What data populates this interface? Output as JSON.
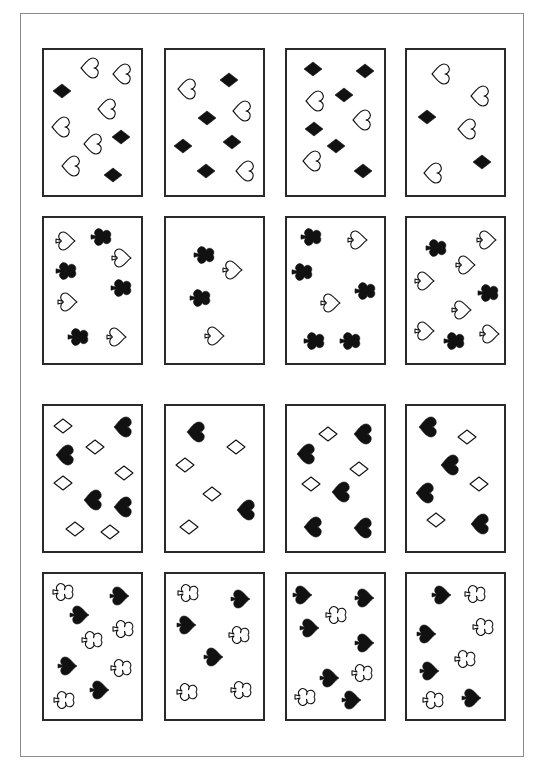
{
  "sheet": {
    "frame": {
      "x": 20,
      "y": 13,
      "w": 504,
      "h": 744
    },
    "colors": {
      "ink": "#111111",
      "card_border": "#2a2a2a",
      "frame_border": "#8a8a8a",
      "paper": "#ffffff"
    },
    "cards": [
      {
        "id": 1,
        "x": 42,
        "y": 48,
        "symbols": [
          {
            "s": "heart",
            "f": false,
            "x": 89,
            "y": 68
          },
          {
            "s": "heart",
            "f": false,
            "x": 121,
            "y": 74
          },
          {
            "s": "diamond",
            "f": true,
            "x": 62,
            "y": 91
          },
          {
            "s": "heart",
            "f": false,
            "x": 60,
            "y": 127
          },
          {
            "s": "heart",
            "f": false,
            "x": 106,
            "y": 109
          },
          {
            "s": "diamond",
            "f": true,
            "x": 121,
            "y": 137
          },
          {
            "s": "heart",
            "f": false,
            "x": 92,
            "y": 144
          },
          {
            "s": "heart",
            "f": false,
            "x": 70,
            "y": 166
          },
          {
            "s": "diamond",
            "f": true,
            "x": 113,
            "y": 175
          }
        ]
      },
      {
        "id": 2,
        "x": 164,
        "y": 48,
        "symbols": [
          {
            "s": "heart",
            "f": false,
            "x": 186,
            "y": 89
          },
          {
            "s": "diamond",
            "f": true,
            "x": 229,
            "y": 80
          },
          {
            "s": "diamond",
            "f": true,
            "x": 207,
            "y": 118
          },
          {
            "s": "heart",
            "f": false,
            "x": 241,
            "y": 111
          },
          {
            "s": "diamond",
            "f": true,
            "x": 183,
            "y": 146
          },
          {
            "s": "diamond",
            "f": true,
            "x": 232,
            "y": 142
          },
          {
            "s": "diamond",
            "f": true,
            "x": 206,
            "y": 171
          },
          {
            "s": "heart",
            "f": false,
            "x": 244,
            "y": 171
          }
        ]
      },
      {
        "id": 3,
        "x": 285,
        "y": 48,
        "symbols": [
          {
            "s": "diamond",
            "f": true,
            "x": 313,
            "y": 69
          },
          {
            "s": "diamond",
            "f": true,
            "x": 365,
            "y": 71
          },
          {
            "s": "heart",
            "f": false,
            "x": 314,
            "y": 101
          },
          {
            "s": "diamond",
            "f": true,
            "x": 344,
            "y": 95
          },
          {
            "s": "heart",
            "f": false,
            "x": 361,
            "y": 120
          },
          {
            "s": "diamond",
            "f": true,
            "x": 314,
            "y": 129
          },
          {
            "s": "diamond",
            "f": true,
            "x": 336,
            "y": 146
          },
          {
            "s": "heart",
            "f": false,
            "x": 311,
            "y": 161
          },
          {
            "s": "diamond",
            "f": true,
            "x": 363,
            "y": 171
          }
        ]
      },
      {
        "id": 4,
        "x": 405,
        "y": 48,
        "symbols": [
          {
            "s": "heart",
            "f": false,
            "x": 440,
            "y": 74
          },
          {
            "s": "heart",
            "f": false,
            "x": 479,
            "y": 96
          },
          {
            "s": "diamond",
            "f": true,
            "x": 427,
            "y": 117
          },
          {
            "s": "heart",
            "f": false,
            "x": 466,
            "y": 129
          },
          {
            "s": "diamond",
            "f": true,
            "x": 482,
            "y": 162
          },
          {
            "s": "heart",
            "f": false,
            "x": 432,
            "y": 173
          }
        ]
      },
      {
        "id": 5,
        "x": 42,
        "y": 216,
        "symbols": [
          {
            "s": "spade",
            "f": false,
            "x": 66,
            "y": 241
          },
          {
            "s": "club",
            "f": true,
            "x": 101,
            "y": 237
          },
          {
            "s": "spade",
            "f": false,
            "x": 122,
            "y": 258
          },
          {
            "s": "club",
            "f": true,
            "x": 66,
            "y": 271
          },
          {
            "s": "club",
            "f": true,
            "x": 121,
            "y": 288
          },
          {
            "s": "spade",
            "f": false,
            "x": 68,
            "y": 302
          },
          {
            "s": "club",
            "f": true,
            "x": 78,
            "y": 337
          },
          {
            "s": "spade",
            "f": false,
            "x": 117,
            "y": 337
          }
        ]
      },
      {
        "id": 6,
        "x": 164,
        "y": 216,
        "symbols": [
          {
            "s": "club",
            "f": true,
            "x": 204,
            "y": 255
          },
          {
            "s": "spade",
            "f": false,
            "x": 233,
            "y": 270
          },
          {
            "s": "club",
            "f": true,
            "x": 200,
            "y": 298
          },
          {
            "s": "spade",
            "f": false,
            "x": 215,
            "y": 336
          }
        ]
      },
      {
        "id": 7,
        "x": 285,
        "y": 216,
        "symbols": [
          {
            "s": "club",
            "f": true,
            "x": 311,
            "y": 237
          },
          {
            "s": "spade",
            "f": false,
            "x": 358,
            "y": 240
          },
          {
            "s": "club",
            "f": true,
            "x": 302,
            "y": 272
          },
          {
            "s": "spade",
            "f": false,
            "x": 331,
            "y": 303
          },
          {
            "s": "club",
            "f": true,
            "x": 365,
            "y": 291
          },
          {
            "s": "club",
            "f": true,
            "x": 314,
            "y": 341
          },
          {
            "s": "club",
            "f": true,
            "x": 350,
            "y": 341
          }
        ]
      },
      {
        "id": 8,
        "x": 405,
        "y": 216,
        "symbols": [
          {
            "s": "club",
            "f": true,
            "x": 436,
            "y": 248
          },
          {
            "s": "spade",
            "f": false,
            "x": 487,
            "y": 240
          },
          {
            "s": "spade",
            "f": false,
            "x": 466,
            "y": 265
          },
          {
            "s": "spade",
            "f": false,
            "x": 425,
            "y": 281
          },
          {
            "s": "club",
            "f": true,
            "x": 488,
            "y": 293
          },
          {
            "s": "spade",
            "f": false,
            "x": 462,
            "y": 310
          },
          {
            "s": "spade",
            "f": false,
            "x": 425,
            "y": 331
          },
          {
            "s": "club",
            "f": true,
            "x": 454,
            "y": 341
          },
          {
            "s": "spade",
            "f": false,
            "x": 490,
            "y": 334
          }
        ]
      },
      {
        "id": 9,
        "x": 42,
        "y": 404,
        "symbols": [
          {
            "s": "diamond",
            "f": false,
            "x": 63,
            "y": 426
          },
          {
            "s": "heart",
            "f": true,
            "x": 122,
            "y": 427
          },
          {
            "s": "heart",
            "f": true,
            "x": 64,
            "y": 455
          },
          {
            "s": "diamond",
            "f": false,
            "x": 95,
            "y": 447
          },
          {
            "s": "diamond",
            "f": false,
            "x": 124,
            "y": 473
          },
          {
            "s": "diamond",
            "f": false,
            "x": 63,
            "y": 483
          },
          {
            "s": "heart",
            "f": true,
            "x": 92,
            "y": 500
          },
          {
            "s": "heart",
            "f": true,
            "x": 122,
            "y": 507
          },
          {
            "s": "diamond",
            "f": false,
            "x": 75,
            "y": 529
          },
          {
            "s": "diamond",
            "f": false,
            "x": 110,
            "y": 532
          }
        ]
      },
      {
        "id": 10,
        "x": 164,
        "y": 404,
        "symbols": [
          {
            "s": "heart",
            "f": true,
            "x": 195,
            "y": 432
          },
          {
            "s": "diamond",
            "f": false,
            "x": 236,
            "y": 447
          },
          {
            "s": "diamond",
            "f": false,
            "x": 185,
            "y": 465
          },
          {
            "s": "diamond",
            "f": false,
            "x": 212,
            "y": 494
          },
          {
            "s": "heart",
            "f": true,
            "x": 245,
            "y": 510
          },
          {
            "s": "diamond",
            "f": false,
            "x": 189,
            "y": 527
          }
        ]
      },
      {
        "id": 11,
        "x": 285,
        "y": 404,
        "symbols": [
          {
            "s": "diamond",
            "f": false,
            "x": 328,
            "y": 434
          },
          {
            "s": "heart",
            "f": true,
            "x": 362,
            "y": 434
          },
          {
            "s": "heart",
            "f": true,
            "x": 305,
            "y": 454
          },
          {
            "s": "diamond",
            "f": false,
            "x": 359,
            "y": 469
          },
          {
            "s": "diamond",
            "f": false,
            "x": 311,
            "y": 484
          },
          {
            "s": "heart",
            "f": true,
            "x": 340,
            "y": 492
          },
          {
            "s": "heart",
            "f": true,
            "x": 312,
            "y": 527
          },
          {
            "s": "heart",
            "f": true,
            "x": 362,
            "y": 528
          }
        ]
      },
      {
        "id": 12,
        "x": 405,
        "y": 404,
        "symbols": [
          {
            "s": "heart",
            "f": true,
            "x": 427,
            "y": 427
          },
          {
            "s": "diamond",
            "f": false,
            "x": 467,
            "y": 437
          },
          {
            "s": "heart",
            "f": true,
            "x": 449,
            "y": 465
          },
          {
            "s": "diamond",
            "f": false,
            "x": 479,
            "y": 484
          },
          {
            "s": "heart",
            "f": true,
            "x": 424,
            "y": 493
          },
          {
            "s": "diamond",
            "f": false,
            "x": 436,
            "y": 520
          },
          {
            "s": "heart",
            "f": true,
            "x": 479,
            "y": 524
          }
        ]
      },
      {
        "id": 13,
        "x": 42,
        "y": 572,
        "symbols": [
          {
            "s": "club",
            "f": false,
            "x": 63,
            "y": 592
          },
          {
            "s": "spade",
            "f": true,
            "x": 120,
            "y": 596
          },
          {
            "s": "spade",
            "f": true,
            "x": 80,
            "y": 615
          },
          {
            "s": "club",
            "f": false,
            "x": 123,
            "y": 629
          },
          {
            "s": "club",
            "f": false,
            "x": 92,
            "y": 640
          },
          {
            "s": "spade",
            "f": true,
            "x": 68,
            "y": 666
          },
          {
            "s": "club",
            "f": false,
            "x": 121,
            "y": 668
          },
          {
            "s": "spade",
            "f": true,
            "x": 100,
            "y": 690
          },
          {
            "s": "club",
            "f": false,
            "x": 64,
            "y": 700
          }
        ]
      },
      {
        "id": 14,
        "x": 164,
        "y": 572,
        "symbols": [
          {
            "s": "club",
            "f": false,
            "x": 188,
            "y": 593
          },
          {
            "s": "spade",
            "f": true,
            "x": 241,
            "y": 599
          },
          {
            "s": "spade",
            "f": true,
            "x": 187,
            "y": 625
          },
          {
            "s": "club",
            "f": false,
            "x": 239,
            "y": 635
          },
          {
            "s": "spade",
            "f": true,
            "x": 214,
            "y": 657
          },
          {
            "s": "club",
            "f": false,
            "x": 187,
            "y": 692
          },
          {
            "s": "club",
            "f": false,
            "x": 241,
            "y": 690
          }
        ]
      },
      {
        "id": 15,
        "x": 285,
        "y": 572,
        "symbols": [
          {
            "s": "spade",
            "f": true,
            "x": 303,
            "y": 595
          },
          {
            "s": "spade",
            "f": true,
            "x": 365,
            "y": 598
          },
          {
            "s": "club",
            "f": false,
            "x": 336,
            "y": 615
          },
          {
            "s": "spade",
            "f": true,
            "x": 310,
            "y": 628
          },
          {
            "s": "spade",
            "f": true,
            "x": 365,
            "y": 643
          },
          {
            "s": "club",
            "f": false,
            "x": 362,
            "y": 673
          },
          {
            "s": "spade",
            "f": true,
            "x": 330,
            "y": 678
          },
          {
            "s": "club",
            "f": false,
            "x": 305,
            "y": 697
          },
          {
            "s": "spade",
            "f": true,
            "x": 352,
            "y": 700
          }
        ]
      },
      {
        "id": 16,
        "x": 405,
        "y": 572,
        "symbols": [
          {
            "s": "spade",
            "f": true,
            "x": 442,
            "y": 595
          },
          {
            "s": "club",
            "f": false,
            "x": 475,
            "y": 594
          },
          {
            "s": "club",
            "f": false,
            "x": 483,
            "y": 627
          },
          {
            "s": "spade",
            "f": true,
            "x": 427,
            "y": 634
          },
          {
            "s": "club",
            "f": false,
            "x": 465,
            "y": 659
          },
          {
            "s": "spade",
            "f": true,
            "x": 430,
            "y": 671
          },
          {
            "s": "club",
            "f": false,
            "x": 433,
            "y": 700
          },
          {
            "s": "spade",
            "f": true,
            "x": 472,
            "y": 698
          }
        ]
      }
    ]
  }
}
